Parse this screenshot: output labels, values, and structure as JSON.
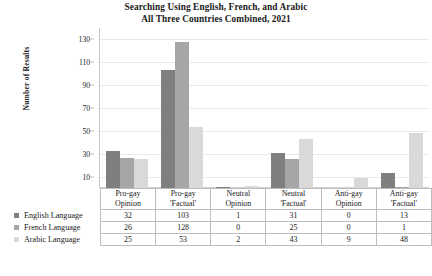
{
  "chart_data": {
    "type": "bar",
    "title": "Searching Using English, French, and Arabic\nAll Three Countries Combined, 2021",
    "title_lines": [
      "Searching Using English, French, and Arabic",
      "All Three Countries Combined, 2021"
    ],
    "xlabel": "",
    "ylabel": "Number of Results",
    "ylim": [
      0,
      140
    ],
    "yticks": [
      130,
      110,
      90,
      70,
      50,
      30,
      10
    ],
    "grid": true,
    "legend_position": "table-row-labels",
    "categories": [
      "Pro-gay Opinion",
      "Pro-gay 'Factual'",
      "Neutral Opinion",
      "Neutral 'Factual'",
      "Anti-gay Opinion",
      "Anti-gay 'Factual'"
    ],
    "category_lines": [
      [
        "Pro-gay",
        "Opinion"
      ],
      [
        "Pro-gay",
        "'Factual'"
      ],
      [
        "Neutral",
        "Opinion"
      ],
      [
        "Neutral",
        "'Factual'"
      ],
      [
        "Anti-gay",
        "Opinion"
      ],
      [
        "Anti-gay",
        "'Factual'"
      ]
    ],
    "series": [
      {
        "name": "English Language",
        "color": "#7f7f7f",
        "values": [
          32,
          103,
          1,
          31,
          0,
          13
        ]
      },
      {
        "name": "French Language",
        "color": "#a6a6a6",
        "values": [
          26,
          128,
          0,
          25,
          0,
          1
        ]
      },
      {
        "name": "Arabic Language",
        "color": "#d9d9d9",
        "values": [
          25,
          53,
          2,
          43,
          9,
          48
        ]
      }
    ]
  },
  "colors": {
    "series_english": "#7f7f7f",
    "series_french": "#a6a6a6",
    "series_arabic": "#d9d9d9",
    "gridline": "#e9e9e9",
    "axis": "#c6c6c6",
    "table_border": "#bdbdbd",
    "text": "#1a1a1a"
  }
}
